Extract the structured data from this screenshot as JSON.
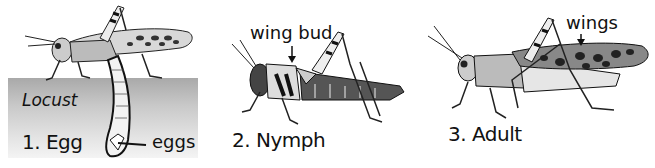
{
  "diagram": {
    "species_label": "Locust",
    "stages": [
      {
        "number": "1.",
        "name": "Egg",
        "label": "1. Egg",
        "callout": "eggs"
      },
      {
        "number": "2.",
        "name": "Nymph",
        "label": "2. Nymph",
        "callout": "wing bud"
      },
      {
        "number": "3.",
        "name": "Adult",
        "label": "3. Adult",
        "callout": "wings"
      }
    ]
  }
}
